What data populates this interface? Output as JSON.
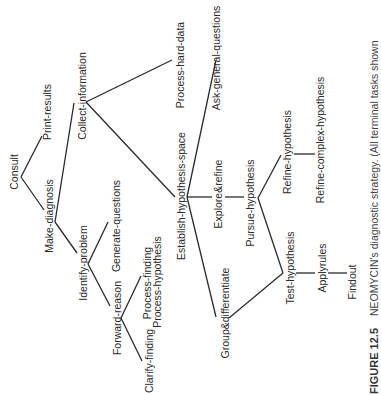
{
  "diagram": {
    "type": "tree",
    "orientation": "rotated-90-ccw",
    "nodes": {
      "consult": "Consult",
      "print_results": "Print-results",
      "make_diagnosis": "Make-diagnosis",
      "collect_information": "Collect-information",
      "identify_problem": "Identify-problem",
      "generate_questions": "Generate-questions",
      "forward_reason": "Forward-reason",
      "process_finding": "Process-finding",
      "process_hypothesis": "Process-hypothesis",
      "clarify_finding": "Clarify-finding",
      "process_hard_data": "Process-hard-data",
      "establish_hypothesis_space": "Establish-hypothesis-space",
      "ask_general_questions": "Ask-general-questions",
      "explore_refine": "Explore&refine",
      "group_differentiate": "Group&differentiate",
      "pursue_hypothesis": "Pursue-hypothesis",
      "refine_hypothesis": "Refine-hypothesis",
      "test_hypothesis": "Test-hypothesis",
      "refine_complex_hypothesis": "Refine-complex-hypothesis",
      "applyrules": "Applyrules",
      "findout": "Findout"
    },
    "edges": [
      [
        "Consult",
        "Print-results"
      ],
      [
        "Consult",
        "Make-diagnosis"
      ],
      [
        "Make-diagnosis",
        "Collect-information"
      ],
      [
        "Make-diagnosis",
        "Identify-problem"
      ],
      [
        "Identify-problem",
        "Generate-questions"
      ],
      [
        "Identify-problem",
        "Forward-reason"
      ],
      [
        "Forward-reason",
        "Process-finding / Process-hypothesis"
      ],
      [
        "Forward-reason",
        "Clarify-finding"
      ],
      [
        "Collect-information",
        "Process-hard-data"
      ],
      [
        "Collect-information",
        "Establish-hypothesis-space"
      ],
      [
        "Establish-hypothesis-space",
        "Ask-general-questions"
      ],
      [
        "Establish-hypothesis-space",
        "Explore&refine"
      ],
      [
        "Establish-hypothesis-space",
        "Group&differentiate"
      ],
      [
        "Explore&refine",
        "Pursue-hypothesis"
      ],
      [
        "Pursue-hypothesis",
        "Refine-hypothesis"
      ],
      [
        "Pursue-hypothesis",
        "Test-hypothesis"
      ],
      [
        "Group&differentiate",
        "Test-hypothesis"
      ],
      [
        "Refine-hypothesis",
        "Refine-complex-hypothesis"
      ],
      [
        "Test-hypothesis",
        "Applyrules"
      ],
      [
        "Applyrules",
        "Findout"
      ]
    ]
  },
  "caption": {
    "label": "FIGURE 12.5",
    "text": "NEOMYCIN's diagnostic strategy. (All terminal tasks shown"
  }
}
